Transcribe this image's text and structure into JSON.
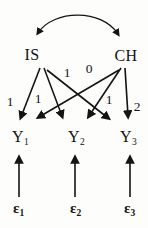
{
  "diagram": {
    "type": "path-diagram",
    "colors": {
      "ink": "#141414",
      "background": "#fdfdfc"
    },
    "latent": [
      {
        "id": "IS",
        "label": "IS"
      },
      {
        "id": "CH",
        "label": "CH"
      }
    ],
    "covariance": {
      "between": [
        "IS",
        "CH"
      ],
      "style": "curved-double-headed-arrow"
    },
    "observed": [
      {
        "id": "Y1",
        "base": "Y",
        "sub": "1"
      },
      {
        "id": "Y2",
        "base": "Y",
        "sub": "2"
      },
      {
        "id": "Y3",
        "base": "Y",
        "sub": "3"
      }
    ],
    "errors": [
      {
        "id": "e1",
        "base": "ε",
        "sub": "1",
        "points_to": "Y1"
      },
      {
        "id": "e2",
        "base": "ε",
        "sub": "2",
        "points_to": "Y2"
      },
      {
        "id": "e3",
        "base": "ε",
        "sub": "3",
        "points_to": "Y3"
      }
    ],
    "edges": [
      {
        "from": "IS",
        "to": "Y1",
        "coef": "1"
      },
      {
        "from": "IS",
        "to": "Y2",
        "coef": "1"
      },
      {
        "from": "IS",
        "to": "Y3",
        "coef": "1"
      },
      {
        "from": "CH",
        "to": "Y1",
        "coef": "0"
      },
      {
        "from": "CH",
        "to": "Y2",
        "coef": "1"
      },
      {
        "from": "CH",
        "to": "Y3",
        "coef": "2"
      }
    ]
  }
}
